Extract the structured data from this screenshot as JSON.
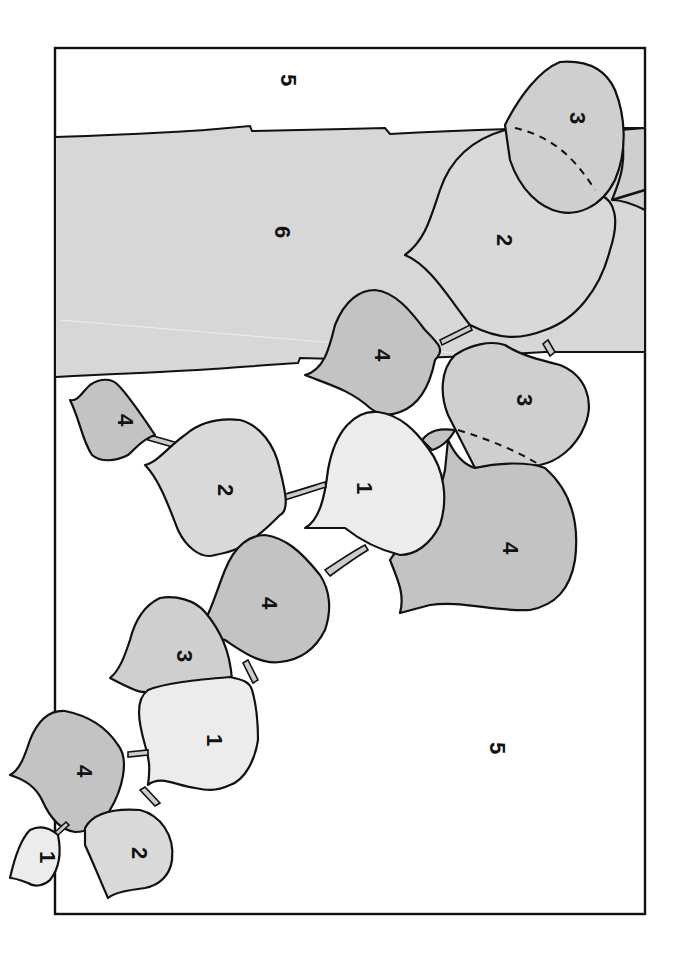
{
  "page": {
    "kind": "paint-by-number coloring page (rotated)",
    "palette": {
      "1": "#ececec",
      "2": "#d9d9d9",
      "3": "#cfcfcf",
      "4": "#c3c3c3",
      "5": "#ffffff",
      "6": "#d7d7d7"
    },
    "regions": [
      {
        "id": "bg-top",
        "number": "5"
      },
      {
        "id": "band",
        "number": "6"
      },
      {
        "id": "bg-bottom",
        "number": "5"
      },
      {
        "id": "leaf-a",
        "number": "3"
      },
      {
        "id": "leaf-b",
        "number": "2"
      },
      {
        "id": "leaf-c",
        "number": "4"
      },
      {
        "id": "leaf-d",
        "number": "3"
      },
      {
        "id": "leaf-e",
        "number": "4"
      },
      {
        "id": "leaf-f",
        "number": "1"
      },
      {
        "id": "leaf-g",
        "number": "4"
      },
      {
        "id": "leaf-h",
        "number": "2"
      },
      {
        "id": "leaf-i",
        "number": "4"
      },
      {
        "id": "leaf-j",
        "number": "3"
      },
      {
        "id": "leaf-k",
        "number": "1"
      },
      {
        "id": "leaf-l",
        "number": "4"
      },
      {
        "id": "leaf-m",
        "number": "2"
      },
      {
        "id": "leaf-n",
        "number": "1"
      }
    ]
  }
}
